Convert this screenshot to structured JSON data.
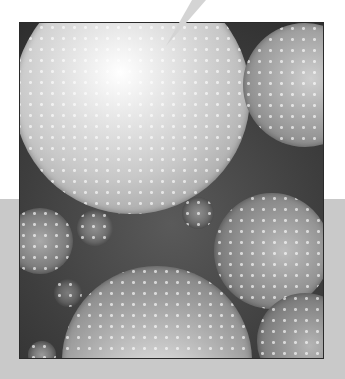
{
  "image": {
    "description": "Grayscale illustration of overlapping bubble universes speckled with stars, framed, over a light gray band",
    "colors": {
      "background_top": "#ffffff",
      "background_band": "#c9c9c9",
      "frame_border": "#2a2a2a",
      "gap_dark": "#3a3a3a",
      "bubble_highlight": "#ffffff",
      "pointer": "#d4d4d4"
    },
    "bubbles": [
      {
        "name": "large-bright-bubble",
        "cx": 112,
        "cy": 73,
        "r": 118,
        "light": "#ffffff",
        "mid": "#c8c8c8",
        "edge": "#8a8a8a",
        "hx": 45,
        "hy": 40
      },
      {
        "name": "top-right-bubble",
        "cx": 285,
        "cy": 62,
        "r": 62,
        "light": "#cfcfcf",
        "mid": "#9c9c9c",
        "edge": "#6e6e6e",
        "hx": 55,
        "hy": 45
      },
      {
        "name": "right-mid-bubble",
        "cx": 252,
        "cy": 228,
        "r": 58,
        "light": "#bdbdbd",
        "mid": "#8c8c8c",
        "edge": "#5f5f5f",
        "hx": 60,
        "hy": 50
      },
      {
        "name": "bottom-right-bubble",
        "cx": 285,
        "cy": 318,
        "r": 48,
        "light": "#b5b5b5",
        "mid": "#858585",
        "edge": "#5a5a5a",
        "hx": 55,
        "hy": 55
      },
      {
        "name": "bottom-center-bubble",
        "cx": 137,
        "cy": 338,
        "r": 95,
        "light": "#f4f4f4",
        "mid": "#a8a8a8",
        "edge": "#6a6a6a",
        "hx": 50,
        "hy": 70
      },
      {
        "name": "left-mid-bubble",
        "cx": 20,
        "cy": 218,
        "r": 33,
        "light": "#aaaaaa",
        "mid": "#7e7e7e",
        "edge": "#555555",
        "hx": 50,
        "hy": 50
      },
      {
        "name": "small-bubble-left-center",
        "cx": 75,
        "cy": 205,
        "r": 18,
        "light": "#8f8f8f",
        "mid": "#6c6c6c",
        "edge": "#4c4c4c",
        "hx": 50,
        "hy": 50
      },
      {
        "name": "small-bubble-center",
        "cx": 178,
        "cy": 190,
        "r": 16,
        "light": "#8f8f8f",
        "mid": "#6a6a6a",
        "edge": "#4a4a4a",
        "hx": 50,
        "hy": 50
      },
      {
        "name": "small-bubble-bottom-left",
        "cx": 22,
        "cy": 332,
        "r": 14,
        "light": "#9a9a9a",
        "mid": "#707070",
        "edge": "#4e4e4e",
        "hx": 50,
        "hy": 50
      },
      {
        "name": "small-bubble-left-lower",
        "cx": 48,
        "cy": 270,
        "r": 14,
        "light": "#7c7c7c",
        "mid": "#606060",
        "edge": "#454545",
        "hx": 50,
        "hy": 50
      }
    ],
    "pointer": {
      "x1": 192,
      "y1": 0,
      "x2": 206,
      "y2": 0,
      "tip_x": 166,
      "tip_y": 46
    }
  }
}
